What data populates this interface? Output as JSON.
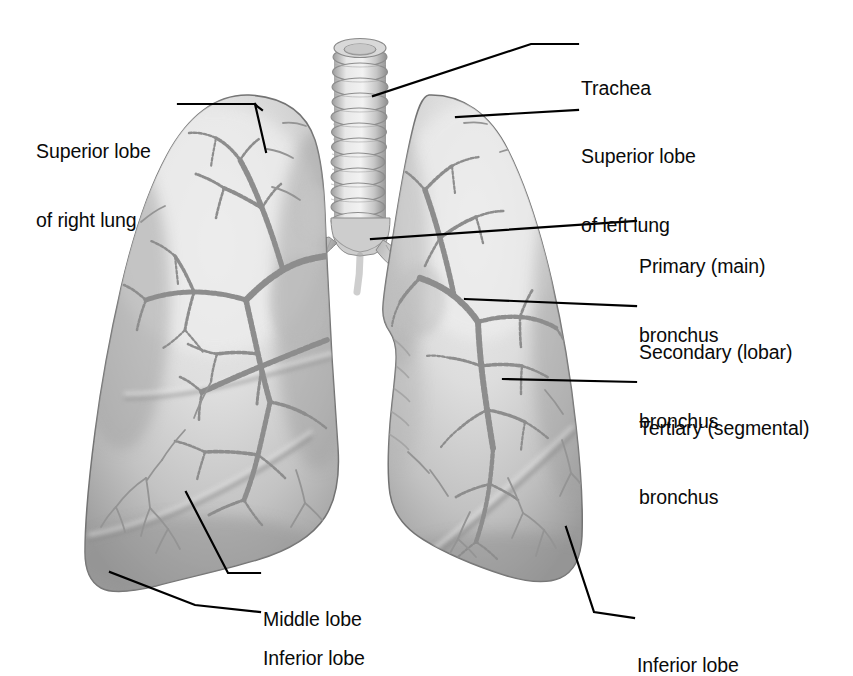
{
  "figure": {
    "background_color": "#ffffff",
    "label_color": "#0a0a0a",
    "leader_line_color": "#000000",
    "lung_fill_light": "#e2e2e2",
    "lung_fill_mid": "#cfcfcf",
    "lung_fill_dark": "#9a9a9a",
    "lung_outline": "#6f6f6f",
    "bronchus_color": "#8f8f8f",
    "bronchus_dark": "#7a7a7a",
    "trachea_fill": "#d4d4d4",
    "trachea_ring": "#8a8a8a"
  },
  "labels": [
    {
      "id": "superior-lobe-right",
      "line1": "Superior lobe",
      "line2": "of right lung",
      "side": "left",
      "x": 36,
      "y": 94
    },
    {
      "id": "trachea",
      "line1": "Trachea",
      "line2": "",
      "side": "right",
      "x": 581,
      "y": 31
    },
    {
      "id": "superior-lobe-left",
      "line1": "Superior lobe",
      "line2": "of left lung",
      "side": "right",
      "x": 581,
      "y": 99
    },
    {
      "id": "primary-bronchus",
      "line1": "Primary (main)",
      "line2": "bronchus",
      "side": "right",
      "x": 639,
      "y": 209
    },
    {
      "id": "secondary-bronchus",
      "line1": "Secondary (lobar)",
      "line2": "bronchus",
      "side": "right",
      "x": 639,
      "y": 295
    },
    {
      "id": "tertiary-bronchus",
      "line1": "Tertiary (segmental)",
      "line2": "bronchus",
      "side": "right",
      "x": 639,
      "y": 371
    },
    {
      "id": "middle-lobe",
      "line1": "Middle lobe",
      "line2": "",
      "side": "left",
      "x": 263,
      "y": 562
    },
    {
      "id": "inferior-lobe-right",
      "line1": "Inferior lobe",
      "line2": "",
      "side": "left",
      "x": 263,
      "y": 601
    },
    {
      "id": "inferior-lobe-left",
      "line1": "Inferior lobe",
      "line2": "",
      "side": "right",
      "x": 637,
      "y": 608
    }
  ],
  "anatomy": {
    "parts": [
      "trachea",
      "right-lung-superior-lobe",
      "right-lung-middle-lobe",
      "right-lung-inferior-lobe",
      "left-lung-superior-lobe",
      "left-lung-inferior-lobe",
      "primary-bronchus",
      "secondary-bronchus",
      "tertiary-bronchus"
    ],
    "trachea_ring_count": 13
  }
}
